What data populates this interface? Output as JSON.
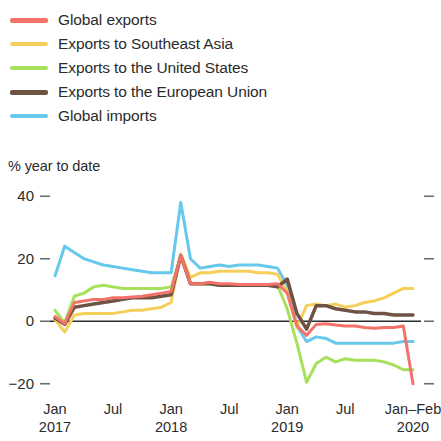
{
  "legend": {
    "items": [
      {
        "label": "Global exports",
        "color": "#f4726a",
        "style": "thick"
      },
      {
        "label": "Exports to Southeast Asia",
        "color": "#f6cf5a",
        "style": "thin"
      },
      {
        "label": "Exports to the United States",
        "color": "#a7e05a",
        "style": "thin"
      },
      {
        "label": "Exports to the European Union",
        "color": "#6e5243",
        "style": "thick"
      },
      {
        "label": "Global imports",
        "color": "#66c8ea",
        "style": "thin"
      }
    ]
  },
  "axis": {
    "y_caption": "% year to date",
    "y_ticks": [
      "40",
      "20",
      "0",
      "−20"
    ],
    "x_ticks": [
      {
        "month": "Jan",
        "year": "2017"
      },
      {
        "month": "Jul",
        "year": ""
      },
      {
        "month": "Jan",
        "year": "2018"
      },
      {
        "month": "Jul",
        "year": ""
      },
      {
        "month": "Jan",
        "year": "2019"
      },
      {
        "month": "Jul",
        "year": ""
      },
      {
        "month": "Jan–Feb",
        "year": "2020"
      }
    ]
  },
  "chart_data": {
    "type": "line",
    "title": "",
    "subtitle": "",
    "xlabel": "",
    "ylabel": "% year to date",
    "ylim": [
      -22,
      42
    ],
    "yticks": [
      -20,
      0,
      20,
      40
    ],
    "grid": false,
    "legend_position": "above-plot",
    "zero_line": true,
    "x_tick_labels": [
      "Jan 2017",
      "Jul",
      "Jan 2018",
      "Jul",
      "Jan 2019",
      "Jul",
      "Jan–Feb 2020"
    ],
    "x_tick_values": [
      0,
      6,
      12,
      18,
      24,
      30,
      37
    ],
    "x": [
      0,
      1,
      2,
      3,
      4,
      5,
      6,
      7,
      8,
      9,
      10,
      11,
      12,
      13,
      14,
      15,
      16,
      17,
      18,
      19,
      20,
      21,
      22,
      23,
      24,
      25,
      26,
      27,
      28,
      29,
      30,
      31,
      32,
      33,
      34,
      35,
      36,
      37
    ],
    "series": [
      {
        "name": "Global exports",
        "color": "#f4726a",
        "width": 3.0,
        "values": [
          1.5,
          -0.8,
          6.0,
          6.5,
          7.0,
          7.0,
          7.5,
          7.5,
          7.8,
          8.0,
          8.5,
          9.0,
          9.5,
          21.0,
          12.0,
          12.0,
          12.5,
          12.0,
          12.0,
          11.8,
          11.8,
          11.8,
          11.8,
          12.0,
          9.0,
          -1.5,
          -4.5,
          -1.0,
          -0.8,
          -1.2,
          -1.5,
          -1.5,
          -2.0,
          -2.2,
          -2.0,
          -2.0,
          -1.5,
          -20.0
        ]
      },
      {
        "name": "Exports to Southeast Asia",
        "color": "#f6cf5a",
        "width": 3.0,
        "values": [
          0.5,
          -3.5,
          2.0,
          2.5,
          2.5,
          2.5,
          2.5,
          3.0,
          3.5,
          3.5,
          4.0,
          4.5,
          6.0,
          21.5,
          14.0,
          15.5,
          15.5,
          16.0,
          16.0,
          16.0,
          16.0,
          15.5,
          15.5,
          15.0,
          9.5,
          -2.0,
          5.0,
          5.5,
          5.0,
          5.5,
          4.5,
          5.0,
          6.0,
          6.5,
          7.5,
          9.0,
          10.5,
          10.5
        ]
      },
      {
        "name": "Exports to the United States",
        "color": "#a7e05a",
        "width": 3.0,
        "values": [
          3.5,
          -0.5,
          8.0,
          9.0,
          11.0,
          11.5,
          11.0,
          10.5,
          10.5,
          10.5,
          10.5,
          10.5,
          11.0,
          21.0,
          12.0,
          12.0,
          12.0,
          11.5,
          11.5,
          11.5,
          11.5,
          11.5,
          11.5,
          11.5,
          4.0,
          -7.0,
          -19.5,
          -13.5,
          -11.5,
          -13.0,
          -12.0,
          -12.5,
          -12.5,
          -12.5,
          -13.0,
          -14.0,
          -15.5,
          -15.5
        ]
      },
      {
        "name": "Exports to the European Union",
        "color": "#6e5243",
        "width": 3.5,
        "values": [
          1.0,
          -1.0,
          4.5,
          5.0,
          5.5,
          6.0,
          6.5,
          7.0,
          7.5,
          7.5,
          7.5,
          8.0,
          8.5,
          21.0,
          12.0,
          12.0,
          12.0,
          11.5,
          11.5,
          11.5,
          11.5,
          11.5,
          11.5,
          11.0,
          13.5,
          2.5,
          -2.5,
          5.0,
          5.0,
          4.0,
          3.5,
          3.0,
          3.0,
          2.5,
          2.5,
          2.0,
          2.0,
          2.0
        ]
      },
      {
        "name": "Global imports",
        "color": "#66c8ea",
        "width": 3.0,
        "values": [
          14.5,
          24.0,
          22.0,
          20.0,
          19.0,
          18.0,
          17.5,
          17.0,
          16.5,
          16.0,
          15.5,
          15.5,
          15.5,
          38.0,
          20.0,
          17.0,
          17.5,
          18.0,
          17.5,
          18.0,
          18.0,
          18.0,
          17.5,
          17.0,
          11.5,
          -1.5,
          -6.5,
          -5.0,
          -5.5,
          -7.0,
          -7.0,
          -7.0,
          -7.0,
          -7.0,
          -7.0,
          -7.0,
          -6.5,
          -6.5
        ]
      }
    ]
  }
}
